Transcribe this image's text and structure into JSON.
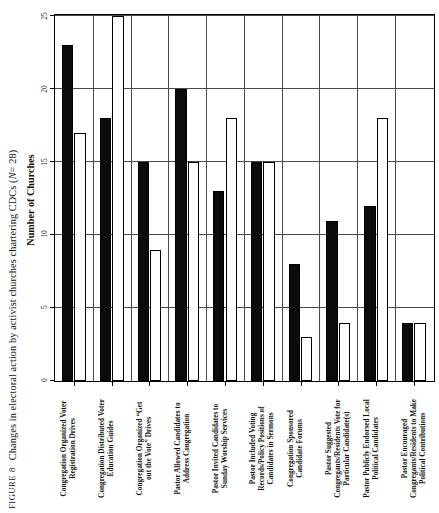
{
  "figure": {
    "label_word": "FIGURE",
    "number": "8",
    "caption": "Changes in electoral action by activist churches chartering CDCs (",
    "n_italic": "N",
    "n_rest": " = 28)"
  },
  "chart_data": {
    "type": "bar",
    "xlabel": "",
    "ylabel": "Number of Churches",
    "ylim": [
      0,
      25
    ],
    "yticks": [
      0,
      5,
      10,
      15,
      20,
      25
    ],
    "grid": true,
    "legend_position": "none",
    "orientation": "vertical",
    "categories": [
      "Congregation Organized Voter Registration Drives",
      "Congregation Distributed Voter Education Guides",
      "Congregation Organized “Get out the Vote” Drives",
      "Pastor Allowed Candidates to Address Congregation",
      "Pastor Invited Candidates to Sunday Worship Services",
      "Pastor Included Voting Records/Policy Positions of Candidates in Sermons",
      "Congregation Sponsored Candidate Forums",
      "Pastor Suggested Congregants/Residents Vote for Particular Candidate(s)",
      "Pastor Publicly Endorsed Local Political Candidates",
      "Pastor Encouraged Congregants/Residents to Make Political Contributions"
    ],
    "category_lines": [
      [
        "Congregation Organized Voter",
        "Registration Drives"
      ],
      [
        "Congregation Distributed Voter",
        "Education Guides"
      ],
      [
        "Congregation Organized “Get",
        "out the Vote” Drives"
      ],
      [
        "Pastor Allowed Candidates to",
        "Address Congregation"
      ],
      [
        "Pastor Invited Candidates to",
        "Sunday Worship Services"
      ],
      [
        "Pastor Included Voting",
        "Records/Policy Positions of",
        "Candidates in Sermons"
      ],
      [
        "Congregation Sponsored",
        "Candidate Forums"
      ],
      [
        "Pastor Suggested",
        "Congregants/Residents Vote for",
        "Particular Candidate(s)"
      ],
      [
        "Pastor Publicly Endorsed Local",
        "Political Candidates"
      ],
      [
        "Pastor Encouraged",
        "Congregants/Residents to Make",
        "Political Contributions"
      ]
    ],
    "series": [
      {
        "name": "Before",
        "style": "filled",
        "color": "#0b0b0b",
        "values": [
          23,
          18,
          15,
          20,
          13,
          15,
          8,
          11,
          12,
          4
        ]
      },
      {
        "name": "After",
        "style": "hollow",
        "color": "#ffffff",
        "values": [
          17,
          25,
          9,
          15,
          18,
          15,
          3,
          4,
          18,
          4
        ]
      }
    ]
  }
}
